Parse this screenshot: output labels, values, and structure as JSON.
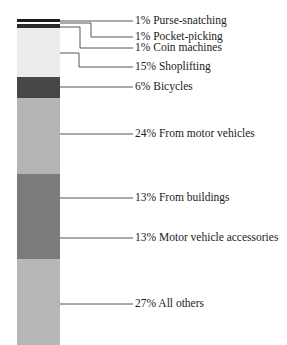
{
  "chart_data": {
    "type": "bar",
    "subtype": "stacked-single-column",
    "title": "",
    "xlabel": "",
    "ylabel": "",
    "ylim": [
      0,
      100
    ],
    "grid": false,
    "legend_position": "right (leader-line labels)",
    "categories": [
      "Purse-snatching",
      "Pocket-picking",
      "Coin machines",
      "Shoplifting",
      "Bicycles",
      "From motor vehicles",
      "From buildings",
      "Motor vehicle accessories",
      "All others"
    ],
    "values": [
      1,
      1,
      1,
      15,
      6,
      24,
      13,
      13,
      27
    ],
    "unit": "%",
    "segments": [
      {
        "name": "Purse-snatching",
        "value": 1,
        "label": "1% Purse-snatching",
        "color": "#1c1c1c",
        "y0": 19,
        "y1": 22,
        "label_y": 21,
        "leader": [
          [
            60,
            21
          ],
          [
            133,
            21
          ]
        ]
      },
      {
        "name": "Pocket-picking",
        "value": 1,
        "label": "1% Pocket-picking",
        "color": "#ffffff",
        "y0": 22,
        "y1": 24,
        "label_y": 37,
        "leader": [
          [
            60,
            23
          ],
          [
            91,
            23
          ],
          [
            91,
            37
          ],
          [
            133,
            37
          ]
        ]
      },
      {
        "name": "Coin machines",
        "value": 1,
        "label": "1% Coin machines",
        "color": "#2a2a2a",
        "y0": 24,
        "y1": 28,
        "label_y": 48,
        "leader": [
          [
            60,
            27
          ],
          [
            80,
            27
          ],
          [
            80,
            48
          ],
          [
            133,
            48
          ]
        ]
      },
      {
        "name": "Shoplifting",
        "value": 15,
        "label": "15% Shoplifting",
        "color": "#ececec",
        "y0": 28,
        "y1": 77,
        "label_y": 67,
        "leader": [
          [
            60,
            53
          ],
          [
            79,
            53
          ],
          [
            79,
            67
          ],
          [
            133,
            67
          ]
        ]
      },
      {
        "name": "Bicycles",
        "value": 6,
        "label": "6% Bicycles",
        "color": "#474747",
        "y0": 77,
        "y1": 98,
        "label_y": 87,
        "leader": [
          [
            60,
            87
          ],
          [
            133,
            87
          ]
        ]
      },
      {
        "name": "From motor vehicles",
        "value": 24,
        "label": "24% From motor vehicles",
        "color": "#b5b5b5",
        "y0": 98,
        "y1": 174,
        "label_y": 134,
        "leader": [
          [
            60,
            134
          ],
          [
            133,
            134
          ]
        ]
      },
      {
        "name": "From buildings",
        "value": 13,
        "label": "13% From buildings",
        "color": "#7b7b7b",
        "y0": 174,
        "y1": 217,
        "label_y": 198,
        "leader": [
          [
            60,
            198
          ],
          [
            133,
            198
          ]
        ]
      },
      {
        "name": "Motor vehicle accessories",
        "value": 13,
        "label": "13% Motor vehicle accessories",
        "color": "#7b7b7b",
        "y0": 217,
        "y1": 259,
        "label_y": 238,
        "leader": [
          [
            60,
            238
          ],
          [
            133,
            238
          ]
        ]
      },
      {
        "name": "All others",
        "value": 27,
        "label": "27% All others",
        "color": "#b7b7b7",
        "y0": 259,
        "y1": 345,
        "label_y": 304,
        "leader": [
          [
            60,
            304
          ],
          [
            133,
            304
          ]
        ]
      }
    ]
  },
  "labels": [
    "1% Purse-snatching",
    "1% Pocket-picking",
    "1% Coin machines",
    "15% Shoplifting",
    "6% Bicycles",
    "24% From motor vehicles",
    "13% From buildings",
    "13% Motor vehicle accessories",
    "27% All others"
  ]
}
